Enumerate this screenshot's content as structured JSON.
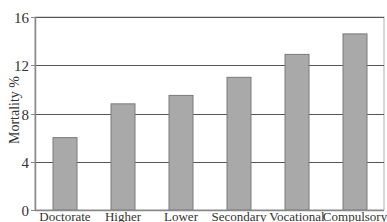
{
  "chart_data": {
    "type": "bar",
    "title": "",
    "xlabel": "",
    "ylabel": "Mortality %",
    "categories": [
      "Doctorate",
      "Higher",
      "Lower",
      "Secondary",
      "Vocational",
      "Compulsory"
    ],
    "values": [
      6.0,
      8.8,
      9.5,
      11.0,
      12.9,
      14.6
    ],
    "ylim": [
      0,
      16
    ],
    "yticks": [
      0,
      4,
      8,
      12,
      16
    ],
    "grid": "horizontal",
    "legend": null,
    "colors": {
      "bar_fill": "#a9a9a9",
      "bar_edge": "#7a7a7a",
      "gridline": "#555555",
      "axis": "#888888",
      "frame": "#b0b0b0"
    }
  },
  "labels": {
    "ylabel": "Mortality %"
  }
}
